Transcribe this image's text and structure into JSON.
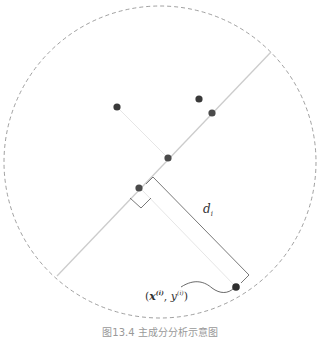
{
  "diagram": {
    "type": "pca-projection-distance",
    "colors": {
      "circle": "#888888",
      "main_axis": "#cccccc",
      "projection_line": "#e4e4e4",
      "bracket": "#555555",
      "points": "#3a3a3a"
    },
    "boundary_circle": {
      "cx": 160,
      "cy": 162,
      "r": 156,
      "style": "dashed"
    },
    "main_axis": {
      "x1": 57,
      "y1": 276,
      "x2": 271,
      "y2": 52
    },
    "points": [
      {
        "id": "p1",
        "x": 117,
        "y": 107
      },
      {
        "id": "p2",
        "x": 199,
        "y": 99
      },
      {
        "id": "p3",
        "x": 212,
        "y": 113
      },
      {
        "id": "p4",
        "x": 168,
        "y": 158
      },
      {
        "id": "p5",
        "x": 139,
        "y": 188
      },
      {
        "id": "p6",
        "x": 236,
        "y": 287
      }
    ],
    "labels": {
      "distance": "d",
      "distance_sub": "i",
      "point_open": "(",
      "point_x": "x",
      "point_x_sup": "(i)",
      "point_sep": ", ",
      "point_y": "y",
      "point_y_sup": "(i)",
      "point_close": ")"
    },
    "caption": "图13.4  主成分分析示意图"
  }
}
